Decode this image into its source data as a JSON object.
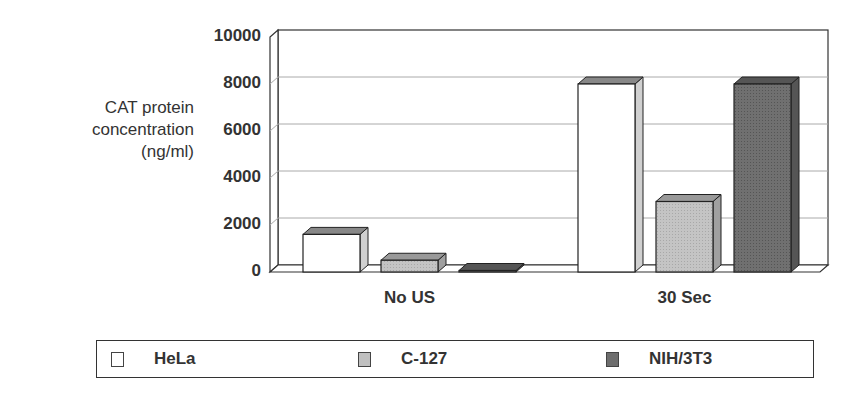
{
  "chart_data": {
    "type": "bar",
    "style": "3d clustered column",
    "title": "",
    "ylabel": "CAT protein concentration (ng/ml)",
    "ylabel_lines": [
      "CAT protein",
      "concentration",
      "(ng/ml)"
    ],
    "xlabel": "",
    "categories": [
      "No US",
      "30 Sec"
    ],
    "series": [
      {
        "name": "HeLa",
        "color": "#ffffff",
        "values": [
          1600,
          8000
        ]
      },
      {
        "name": "C-127",
        "color": "#c0c0c0",
        "values": [
          500,
          3000
        ]
      },
      {
        "name": "NIH/3T3",
        "color": "#6e6e6e",
        "values": [
          0,
          8000
        ]
      }
    ],
    "ylim": [
      0,
      10000
    ],
    "yticks": [
      0,
      2000,
      4000,
      6000,
      8000,
      10000
    ],
    "ytick_labels": [
      "0",
      "2000",
      "4000",
      "6000",
      "8000",
      "10000"
    ],
    "grid": true,
    "legend_position": "bottom"
  },
  "legend": {
    "items": [
      {
        "label": "HeLa",
        "color": "#ffffff"
      },
      {
        "label": "C-127",
        "color": "#c0c0c0"
      },
      {
        "label": "NIH/3T3",
        "color": "#6e6e6e"
      }
    ]
  }
}
